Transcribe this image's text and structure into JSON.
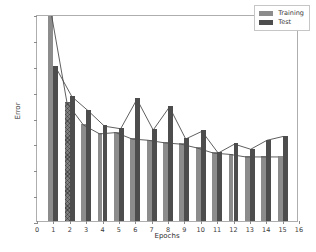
{
  "chart_data": {
    "type": "bar",
    "title": "",
    "subtitle": "",
    "xlabel": "Epochs",
    "ylabel": "Error",
    "xlim": [
      0,
      16
    ],
    "ylim": [
      0.0,
      0.8
    ],
    "xticks": [
      0,
      1,
      2,
      3,
      4,
      5,
      6,
      7,
      8,
      9,
      10,
      11,
      12,
      13,
      14,
      15,
      16
    ],
    "xticklabels": [
      "0",
      "1",
      "2",
      "3",
      "4",
      "5",
      "6",
      "7",
      "8",
      "9",
      "10",
      "11",
      "12",
      "13",
      "14",
      "15",
      "16"
    ],
    "yticks": [
      0.0,
      0.1,
      0.2,
      0.3,
      0.4,
      0.5,
      0.6,
      0.7,
      0.8
    ],
    "yticklabels": [
      "0.0",
      "0.1",
      "0.2",
      "0.3",
      "0.4",
      "0.5",
      "0.6",
      "0.7",
      "0.8"
    ],
    "grid": false,
    "legend_position": "upper right",
    "categories": [
      1,
      2,
      3,
      4,
      5,
      6,
      7,
      8,
      9,
      10,
      11,
      12,
      13,
      14,
      15
    ],
    "series": [
      {
        "name": "Training",
        "color": "#8c8c8c",
        "values": [
          0.82,
          0.46,
          0.375,
          0.34,
          0.345,
          0.32,
          0.315,
          0.305,
          0.3,
          0.285,
          0.265,
          0.26,
          0.25,
          0.25,
          0.25
        ],
        "has_line_overlay": true,
        "hatched_bars": [
          2
        ]
      },
      {
        "name": "Test",
        "color": "#4d4d4d",
        "values": [
          0.6,
          0.485,
          0.43,
          0.37,
          0.36,
          0.475,
          0.355,
          0.445,
          0.32,
          0.35,
          0.265,
          0.3,
          0.28,
          0.315,
          0.33
        ],
        "has_line_overlay": true,
        "hatched_bars": []
      }
    ],
    "line_color": "#4d4d4d"
  },
  "legend": {
    "entries": [
      {
        "label": "Training"
      },
      {
        "label": "Test"
      }
    ]
  }
}
